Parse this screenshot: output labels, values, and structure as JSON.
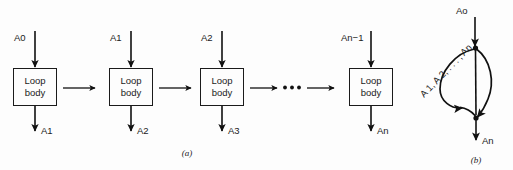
{
  "figure": {
    "panels": [
      {
        "id": "a",
        "caption": "(a)",
        "stages": [
          {
            "input_label": "A0",
            "box_line1": "Loop",
            "box_line2": "body",
            "output_label": "A1"
          },
          {
            "input_label": "A1",
            "box_line1": "Loop",
            "box_line2": "body",
            "output_label": "A2"
          },
          {
            "input_label": "A2",
            "box_line1": "Loop",
            "box_line2": "body",
            "output_label": "A3"
          },
          {
            "input_label": "An−1",
            "box_line1": "Loop",
            "box_line2": "body",
            "output_label": "An"
          }
        ],
        "ellipsis": "•••"
      },
      {
        "id": "b",
        "caption": "(b)",
        "input_label": "Ao",
        "loop_label": "A 1, A 2, . . . , An",
        "output_label": "An"
      }
    ]
  },
  "colors": {
    "ink": "#111111",
    "text": "#1b1b1b",
    "background": "#fdfdfd",
    "box_fill": "#fdfdfd"
  }
}
